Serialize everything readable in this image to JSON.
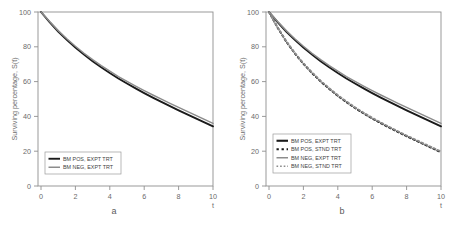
{
  "figure": {
    "panels": [
      {
        "caption": "a",
        "ylabel": "Surviving percentage, S(t)",
        "xlabel": "t",
        "yticks": [
          "0",
          "20",
          "40",
          "60",
          "80",
          "100"
        ],
        "xticks": [
          "0",
          "2",
          "4",
          "6",
          "8",
          "10"
        ],
        "legend": [
          {
            "label": "BM POS, EXPT TRT",
            "color": "#1a1a1a",
            "style": "solid",
            "width": 1.9
          },
          {
            "label": "BM NEG, EXPT TRT",
            "color": "#8c8c8c",
            "style": "solid",
            "width": 1.5
          }
        ]
      },
      {
        "caption": "b",
        "ylabel": "Surviving percentage, S(t)",
        "xlabel": "t",
        "yticks": [
          "0",
          "20",
          "40",
          "60",
          "80",
          "100"
        ],
        "xticks": [
          "0",
          "2",
          "4",
          "6",
          "8",
          "10"
        ],
        "legend": [
          {
            "label": "BM POS, EXPT TRT",
            "color": "#1a1a1a",
            "style": "solid",
            "width": 2.1
          },
          {
            "label": "BM POS, STND TRT",
            "color": "#1a1a1a",
            "style": "dashed",
            "width": 2.1
          },
          {
            "label": "BM NEG, EXPT TRT",
            "color": "#8c8c8c",
            "style": "solid",
            "width": 1.5
          },
          {
            "label": "BM NEG, STND TRT",
            "color": "#8c8c8c",
            "style": "dashed",
            "width": 1.5
          }
        ]
      }
    ]
  },
  "chart_data": [
    {
      "type": "line",
      "title": "",
      "panel": "a",
      "xlabel": "t",
      "ylabel": "Surviving percentage, S(t)",
      "xlim": [
        0,
        10
      ],
      "ylim": [
        0,
        100
      ],
      "xticks": [
        0,
        2,
        4,
        6,
        8,
        10
      ],
      "yticks": [
        0,
        20,
        40,
        60,
        80,
        100
      ],
      "grid": false,
      "legend_position": "bottom-left",
      "x": [
        0,
        0.5,
        1,
        1.5,
        2,
        2.5,
        3,
        3.5,
        4,
        4.5,
        5,
        5.5,
        6,
        6.5,
        7,
        7.5,
        8,
        8.5,
        9,
        9.5,
        10
      ],
      "series": [
        {
          "name": "BM POS, EXPT TRT",
          "color": "#1a1a1a",
          "style": "solid",
          "values": [
            100.0,
            94.2,
            88.8,
            84.0,
            79.6,
            75.5,
            71.7,
            68.2,
            64.9,
            61.8,
            58.9,
            56.1,
            53.4,
            50.8,
            48.3,
            45.9,
            43.5,
            41.2,
            38.9,
            36.6,
            34.3
          ]
        },
        {
          "name": "BM NEG, EXPT TRT",
          "color": "#8c8c8c",
          "style": "solid",
          "values": [
            100.0,
            94.5,
            89.3,
            84.6,
            80.3,
            76.3,
            72.6,
            69.2,
            66.0,
            62.9,
            60.1,
            57.4,
            54.8,
            52.3,
            49.9,
            47.5,
            45.2,
            42.9,
            40.6,
            38.3,
            36.0
          ]
        }
      ]
    },
    {
      "type": "line",
      "title": "",
      "panel": "b",
      "xlabel": "t",
      "ylabel": "Surviving percentage, S(t)",
      "xlim": [
        0,
        10
      ],
      "ylim": [
        0,
        100
      ],
      "xticks": [
        0,
        2,
        4,
        6,
        8,
        10
      ],
      "yticks": [
        0,
        20,
        40,
        60,
        80,
        100
      ],
      "grid": false,
      "legend_position": "bottom-left",
      "x": [
        0,
        0.5,
        1,
        1.5,
        2,
        2.5,
        3,
        3.5,
        4,
        4.5,
        5,
        5.5,
        6,
        6.5,
        7,
        7.5,
        8,
        8.5,
        9,
        9.5,
        10
      ],
      "series": [
        {
          "name": "BM POS, EXPT TRT",
          "color": "#1a1a1a",
          "style": "solid",
          "values": [
            100.0,
            94.2,
            88.8,
            84.0,
            79.6,
            75.5,
            71.7,
            68.2,
            64.9,
            61.8,
            58.9,
            56.1,
            53.4,
            50.8,
            48.3,
            45.9,
            43.5,
            41.2,
            38.9,
            36.6,
            34.3
          ]
        },
        {
          "name": "BM POS, STND TRT",
          "color": "#1a1a1a",
          "style": "dashed",
          "values": [
            100.0,
            91.0,
            83.0,
            76.2,
            70.2,
            64.9,
            60.1,
            55.8,
            51.8,
            48.2,
            44.8,
            41.7,
            38.8,
            36.1,
            33.5,
            31.0,
            28.6,
            26.3,
            24.0,
            21.7,
            19.4
          ]
        },
        {
          "name": "BM NEG, EXPT TRT",
          "color": "#8c8c8c",
          "style": "solid",
          "values": [
            100.0,
            94.5,
            89.3,
            84.6,
            80.3,
            76.3,
            72.6,
            69.2,
            66.0,
            62.9,
            60.1,
            57.4,
            54.8,
            52.3,
            49.9,
            47.5,
            45.2,
            42.9,
            40.6,
            38.3,
            36.0
          ]
        },
        {
          "name": "BM NEG, STND TRT",
          "color": "#8c8c8c",
          "style": "dashed",
          "values": [
            100.0,
            91.2,
            83.3,
            76.5,
            70.6,
            65.3,
            60.5,
            56.2,
            52.2,
            48.6,
            45.2,
            42.1,
            39.2,
            36.5,
            33.9,
            31.4,
            29.0,
            26.7,
            24.4,
            22.1,
            19.8
          ]
        }
      ]
    }
  ]
}
